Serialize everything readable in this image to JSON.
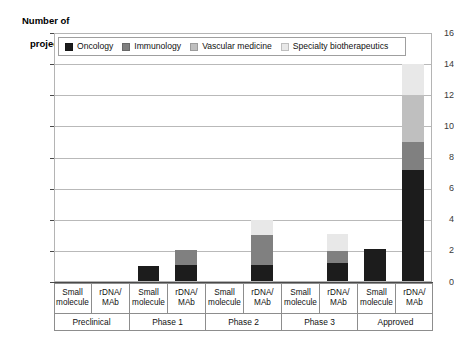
{
  "chart_data": {
    "type": "bar",
    "stacked": true,
    "title": "",
    "ylabel": "Number of\nprojects",
    "xlabel": "",
    "ylim": [
      0,
      16
    ],
    "ytick_step": 2,
    "yticks": [
      0,
      2,
      4,
      6,
      8,
      10,
      12,
      14,
      16
    ],
    "grid": true,
    "legend_position": "top-inside",
    "categories": [
      "Small molecule",
      "rDNA/MAb",
      "Small molecule",
      "rDNA/MAb",
      "Small molecule",
      "rDNA/MAb",
      "Small molecule",
      "rDNA/MAb",
      "Small molecule",
      "rDNA/MAb"
    ],
    "group_labels": [
      "Preclinical",
      "Phase 1",
      "Phase 2",
      "Phase 3",
      "Approved"
    ],
    "series": [
      {
        "name": "Oncology",
        "color": "#1c1c1c",
        "values": [
          0,
          0,
          1.05,
          1.1,
          0,
          1.1,
          0,
          1.2,
          2.15,
          7.2
        ]
      },
      {
        "name": "Immunology",
        "color": "#808080",
        "values": [
          0,
          0,
          0,
          0.95,
          0,
          1.95,
          0,
          0.8,
          0,
          1.8
        ]
      },
      {
        "name": "Vascular medicine",
        "color": "#bfbfbf",
        "values": [
          0,
          0,
          0,
          0,
          0,
          0,
          0,
          0,
          0,
          3.0
        ]
      },
      {
        "name": "Specialty biotherapeutics",
        "color": "#e8e8e8",
        "values": [
          0,
          0,
          0,
          0,
          0,
          0.95,
          0,
          1.1,
          0,
          2.0
        ]
      }
    ],
    "totals": [
      0,
      0,
      1.05,
      2.05,
      0,
      4.0,
      0,
      3.1,
      2.15,
      14.0
    ]
  },
  "axis": {
    "y_title_line1": "Number of",
    "y_title_line2": "projects",
    "y_labels": [
      "16",
      "14",
      "12",
      "10",
      "8",
      "6",
      "4",
      "2",
      "0"
    ]
  },
  "legend": {
    "items": [
      {
        "label": "Oncology",
        "color": "#1c1c1c"
      },
      {
        "label": "Immunology",
        "color": "#808080"
      },
      {
        "label": "Vascular medicine",
        "color": "#bfbfbf"
      },
      {
        "label": "Specialty biotherapeutics",
        "color": "#e8e8e8"
      }
    ]
  }
}
